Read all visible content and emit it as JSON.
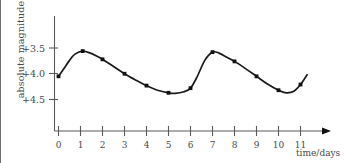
{
  "chart_data": {
    "type": "line",
    "title": "",
    "subtitle": "",
    "xlabel": "time/days",
    "ylabel": "absolute magnitude",
    "xlim": [
      0,
      11.6
    ],
    "ylim": [
      4.65,
      3.3
    ],
    "y_axis_inverted": true,
    "grid": false,
    "legend": null,
    "x_ticks": [
      "0",
      "1",
      "2",
      "3",
      "4",
      "5",
      "6",
      "7",
      "8",
      "9",
      "10",
      "11"
    ],
    "x_tick_values": [
      0,
      1,
      2,
      3,
      4,
      5,
      6,
      7,
      8,
      9,
      10,
      11
    ],
    "y_ticks": [
      "+3.5",
      "+4.0",
      "+4.5"
    ],
    "y_tick_values": [
      3.5,
      4.0,
      4.5
    ],
    "series": [
      {
        "name": "absolute magnitude",
        "marker": "square",
        "markers_shown_at": [
          0,
          1.1,
          2,
          3,
          4,
          5,
          6,
          7,
          8,
          9,
          10,
          11
        ],
        "x": [
          0,
          1.1,
          2,
          3,
          4,
          5,
          6,
          7,
          8,
          9,
          10,
          11
        ],
        "values": [
          4.05,
          3.56,
          3.72,
          4.0,
          4.23,
          4.37,
          4.28,
          3.58,
          3.76,
          4.05,
          4.32,
          4.21
        ]
      }
    ],
    "curve_points": {
      "x": [
        0,
        0.25,
        0.5,
        0.75,
        1.1,
        1.45,
        1.75,
        2,
        2.5,
        3,
        3.5,
        4,
        4.5,
        5,
        5.3,
        5.7,
        6,
        6.3,
        6.65,
        7,
        7.3,
        7.65,
        8,
        8.5,
        9,
        9.5,
        10,
        10.35,
        10.7,
        11,
        11.3
      ],
      "y": [
        4.05,
        3.9,
        3.74,
        3.62,
        3.56,
        3.6,
        3.66,
        3.72,
        3.86,
        4.0,
        4.12,
        4.23,
        4.32,
        4.37,
        4.38,
        4.35,
        4.28,
        4.06,
        3.74,
        3.58,
        3.6,
        3.68,
        3.76,
        3.9,
        4.05,
        4.2,
        4.32,
        4.37,
        4.34,
        4.21,
        4.02
      ]
    },
    "annotations": []
  }
}
